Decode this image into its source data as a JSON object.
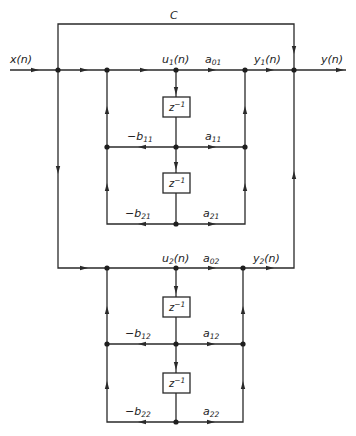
{
  "diagram": {
    "type": "signal-flow-graph",
    "input": {
      "label": "x(n)"
    },
    "output": {
      "label": "y(n)"
    },
    "feedforward_gain": {
      "label": "C"
    },
    "delay_label": {
      "base": "z",
      "exp": "−1"
    },
    "sections": [
      {
        "internal": {
          "base": "u",
          "sub": "1",
          "arg": "(n)"
        },
        "output": {
          "base": "y",
          "sub": "1",
          "arg": "(n)"
        },
        "a0": {
          "base": "a",
          "sub": "01"
        },
        "a1": {
          "base": "a",
          "sub": "11"
        },
        "a2": {
          "base": "a",
          "sub": "21"
        },
        "b1": {
          "base": "−b",
          "sub": "11"
        },
        "b2": {
          "base": "−b",
          "sub": "21"
        }
      },
      {
        "internal": {
          "base": "u",
          "sub": "2",
          "arg": "(n)"
        },
        "output": {
          "base": "y",
          "sub": "2",
          "arg": "(n)"
        },
        "a0": {
          "base": "a",
          "sub": "02"
        },
        "a1": {
          "base": "a",
          "sub": "12"
        },
        "a2": {
          "base": "a",
          "sub": "22"
        },
        "b1": {
          "base": "−b",
          "sub": "12"
        },
        "b2": {
          "base": "−b",
          "sub": "22"
        }
      }
    ]
  }
}
